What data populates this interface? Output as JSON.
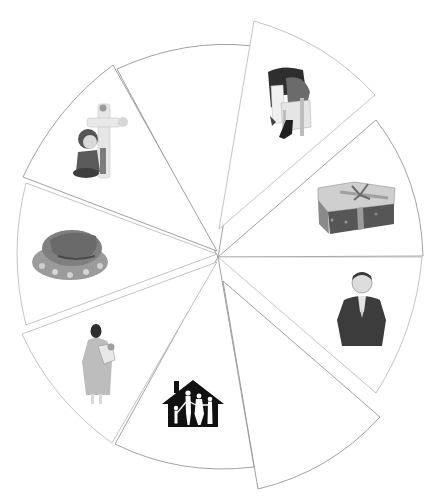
{
  "page": {
    "caption": "",
    "background": "#ffffff",
    "line_color": "#8a8a8a"
  },
  "wheel": {
    "segment_count": 9,
    "segments": [
      {
        "id": "top-empty",
        "label": "",
        "picture": "none"
      },
      {
        "id": "couple",
        "label": "",
        "picture": "couple-embracing-on-chair"
      },
      {
        "id": "gift",
        "label": "",
        "picture": "wrapped-gift-box"
      },
      {
        "id": "praying",
        "label": "",
        "picture": "person-praying"
      },
      {
        "id": "bottom-empty",
        "label": "",
        "picture": "none"
      },
      {
        "id": "home",
        "label": "",
        "picture": "family-in-house-silhouette"
      },
      {
        "id": "mother",
        "label": "",
        "picture": "mother-holding-baby"
      },
      {
        "id": "turkey",
        "label": "",
        "picture": "roast-turkey"
      },
      {
        "id": "boy",
        "label": "",
        "picture": "boy-kneeling-by-cross"
      }
    ]
  }
}
